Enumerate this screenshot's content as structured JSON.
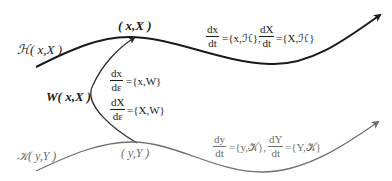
{
  "diagram": {
    "top_curve": {
      "label": "ℋ( x,X )",
      "point_label": "( x,X )",
      "color": "#1a1a1a",
      "equations": {
        "frac1_num": "dx",
        "frac1_den": "dt",
        "rhs1": "={x,ℋ},",
        "frac2_num": "dX",
        "frac2_den": "dt",
        "rhs2": "={X,ℋ}"
      }
    },
    "connector": {
      "label": "W( x,X )",
      "color": "#2a2a2a",
      "equations": {
        "frac1_num": "dx",
        "frac1_den": "dε",
        "rhs1": "={x,W}",
        "frac2_num": "dX",
        "frac2_den": "dε",
        "rhs2": "={X,W}"
      }
    },
    "bottom_curve": {
      "label": "𝒦( y,Y )",
      "point_label": "( y,Y )",
      "color": "#6e6e6e",
      "equations": {
        "frac1_num": "dy",
        "frac1_den": "dt",
        "rhs1": "={y,𝒦},",
        "frac2_num": "dY",
        "frac2_den": "dt",
        "rhs2": "={Y,𝒦}"
      }
    }
  }
}
